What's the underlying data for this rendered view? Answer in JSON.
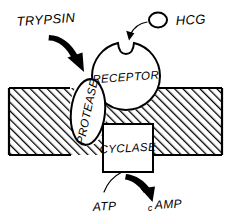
{
  "figure": {
    "background_color": "#ffffff",
    "ink_color": "#000000",
    "width": 231,
    "height": 224
  },
  "labels": {
    "trypsin": "TRYPSIN",
    "hcg": "HCG",
    "receptor": "RECEPTOR",
    "protease": "PROTEASE",
    "cyclase": "CYCLASE",
    "atp": "ATP",
    "camp_prefix": "c",
    "camp_suffix": "AMP",
    "camp_full": "cAMP"
  },
  "elements": {
    "membrane": {
      "name": "cell-membrane",
      "fill_pattern": "diagonal-hatch",
      "hatch_direction": "lower-left-to-upper-right",
      "top_y": 88,
      "bottom_y": 155
    },
    "receptor": {
      "name": "receptor-body",
      "shape": "circle-with-top-notch",
      "cx": 126,
      "cy": 76,
      "r": 34
    },
    "protease": {
      "name": "protease-body",
      "shape": "vertical-ellipse",
      "cx": 88,
      "cy": 112,
      "rx": 17,
      "ry": 33,
      "text_rotation_deg": -78
    },
    "hcg_ligand": {
      "name": "hcg-ligand",
      "shape": "small-ellipse",
      "cx": 158,
      "cy": 20,
      "rx": 9,
      "ry": 7.5
    },
    "cyclase_box": {
      "name": "cyclase-box",
      "shape": "rectangle",
      "x": 103,
      "y": 124,
      "width": 50,
      "height": 48
    }
  },
  "arrows": {
    "trypsin_arrow": {
      "name": "trypsin-to-protease-arrow",
      "style": "thick-curved",
      "from": "TRYPSIN",
      "to": "PROTEASE"
    },
    "hcg_arrow": {
      "name": "hcg-to-receptor-arrow",
      "style": "thin-curved",
      "from": "HCG",
      "to": "RECEPTOR"
    },
    "atp_line": {
      "name": "atp-to-cyclase-line",
      "style": "thin-curve-no-head",
      "from": "ATP",
      "to": "CYCLASE"
    },
    "camp_arrow": {
      "name": "cyclase-to-camp-arrow",
      "style": "thick-curved",
      "from": "CYCLASE",
      "to": "cAMP"
    }
  }
}
